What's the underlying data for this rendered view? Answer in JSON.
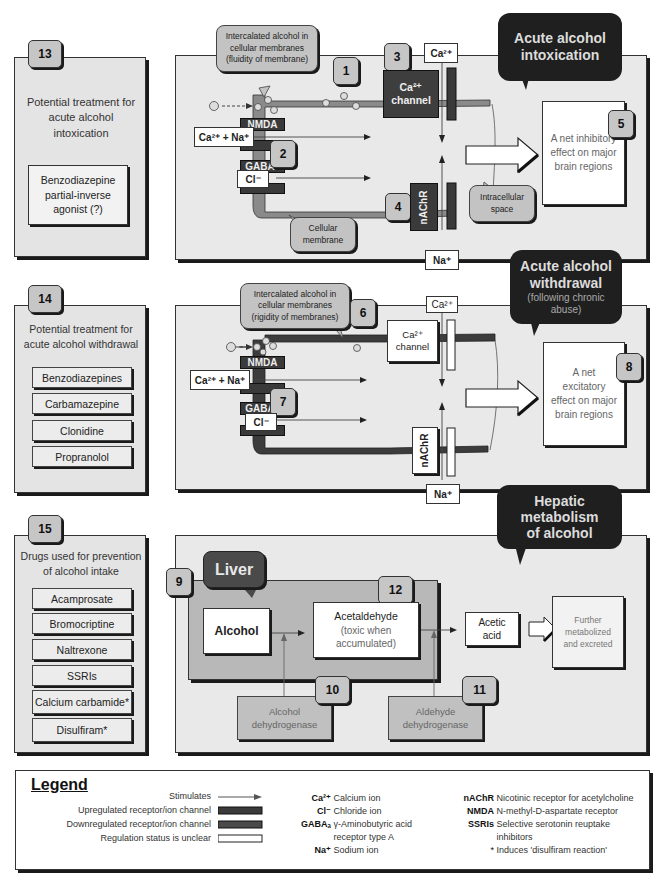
{
  "colors": {
    "panel_bg": "#e9e9e9",
    "dark_bubble": "#1f1f1f",
    "upregulated": "#3a3a3a",
    "downregulated": "#4a4a4a",
    "liver_bubble": "#4a4a4a",
    "number_badge": "#c6c6c6"
  },
  "panel13": {
    "number": "13",
    "title": "Potential treatment for acute alcohol intoxication",
    "box": "Benzodiazepine partial-inverse agonist (?)"
  },
  "panel14": {
    "number": "14",
    "title": "Potential treatment for acute alcohol withdrawal",
    "drugs": [
      "Benzodiazepines",
      "Carbamazepine",
      "Clonidine",
      "Propranolol"
    ]
  },
  "panel15": {
    "number": "15",
    "title": "Drugs used for prevention of alcohol intake",
    "drugs": [
      "Acamprosate",
      "Bromocriptine",
      "Naltrexone",
      "SSRIs",
      "Calcium carbamide*",
      "Disulfiram*"
    ]
  },
  "intoxication": {
    "title_line1": "Acute alcohol",
    "title_line2": "intoxication",
    "bubble1": "Intercalated alcohol in cellular membranes (fluidity of membrane)",
    "n1": "1",
    "n2": "2",
    "n3": "3",
    "n4": "4",
    "n5": "5",
    "ion_ca_na": "Ca²⁺ + Na⁺",
    "ion_cl": "Cl⁻",
    "ion_ca_top": "Ca²⁺",
    "ion_na_bottom": "Na⁺",
    "nmda": "NMDA",
    "gaba": "GABA",
    "gaba_sub": "A",
    "ca_channel_line1": "Ca²⁺",
    "ca_channel_line2": "channel",
    "nachr": "nAChR",
    "membrane_label": "Cellular membrane",
    "intracellular_label": "Intracellular space",
    "effect": "A net inhibitory effect on major brain regions"
  },
  "withdrawal": {
    "title_line1": "Acute alcohol",
    "title_line2": "withdrawal",
    "title_sub": "(following chronic abuse)",
    "bubble6": "Intercalated alcohol in cellular membranes (rigidity of membranes)",
    "n6": "6",
    "n7": "7",
    "n8": "8",
    "ion_ca_na": "Ca²⁺ + Na⁺",
    "ion_cl": "Cl⁻",
    "ion_ca_top": "Ca²⁺",
    "ion_na_bottom": "Na⁺",
    "nmda": "NMDA",
    "gaba": "GABA",
    "gaba_sub": "A",
    "ca_channel_line1": "Ca²⁺",
    "ca_channel_line2": "channel",
    "nachr": "nAChR",
    "effect": "A net excitatory effect on major brain regions"
  },
  "hepatic": {
    "title_line1": "Hepatic",
    "title_line2": "metabolism",
    "title_line3": "of alcohol",
    "liver": "Liver",
    "n9": "9",
    "n10": "10",
    "n11": "11",
    "n12": "12",
    "alcohol": "Alcohol",
    "acetaldehyde": "Acetaldehyde",
    "acetaldehyde_note": "(toxic when accumulated)",
    "acetic_acid": "Acetic acid",
    "further": "Further metabolized and excreted",
    "enzyme1": "Alcohol dehydrogenase",
    "enzyme2": "Aldehyde dehydrogenase"
  },
  "legend": {
    "title": "Legend",
    "symbols": [
      {
        "label": "Stimulates",
        "symbol": "arrow"
      },
      {
        "label": "Upregulated receptor/ion channel",
        "symbol": "dark-bar"
      },
      {
        "label": "Downregulated receptor/ion channel",
        "symbol": "dark-bar"
      },
      {
        "label": "Regulation status is unclear",
        "symbol": "white-bar"
      }
    ],
    "ions": [
      {
        "key": "Ca²⁺",
        "value": "Calcium ion"
      },
      {
        "key": "Cl⁻",
        "value": "Chloride ion"
      },
      {
        "key": "GABAₐ",
        "value": "γ-Aminobutyric acid"
      },
      {
        "key": "",
        "value": "receptor type A"
      },
      {
        "key": "Na⁺",
        "value": "Sodium ion"
      }
    ],
    "abbrevs": [
      {
        "key": "nAChR",
        "value": "Nicotinic receptor for acetylcholine"
      },
      {
        "key": "NMDA",
        "value": "N-methyl-D-aspartate receptor"
      },
      {
        "key": "SSRIs",
        "value": "Selective serotonin reuptake"
      },
      {
        "key": "",
        "value": "inhibitors"
      },
      {
        "key": "*",
        "value": "Induces 'disulfiram reaction'"
      }
    ]
  }
}
